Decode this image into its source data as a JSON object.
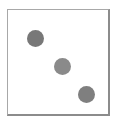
{
  "panel": {
    "label": "dot-panel",
    "background_color": "#ffffff",
    "border_color": "#a8a8a8",
    "border_shadow_color": "#8c8c8c",
    "frame": {
      "left": 7,
      "top": 9,
      "width": 103,
      "height": 107
    }
  },
  "chart_data": {
    "type": "scatter",
    "title": "",
    "subtitle": "",
    "xlabel": "",
    "ylabel": "",
    "xlim": [
      0,
      100
    ],
    "ylim": [
      0,
      100
    ],
    "grid": false,
    "legend": null,
    "tick_labels": {
      "x": [],
      "y": []
    },
    "annotations": [],
    "marker": {
      "shape": "circle",
      "size_px": 17
    },
    "series": [
      {
        "name": "dots",
        "color": "#7d7d7d",
        "points": [
          {
            "id": "dot-1",
            "x": 21,
            "y": 74,
            "px_left": 19,
            "px_top": 20,
            "px_diameter": 17,
            "color": "#787878"
          },
          {
            "id": "dot-2",
            "x": 48,
            "y": 46,
            "px_left": 46,
            "px_top": 48,
            "px_diameter": 17,
            "color": "#8a8a8a"
          },
          {
            "id": "dot-3",
            "x": 72,
            "y": 19,
            "px_left": 70,
            "px_top": 76,
            "px_diameter": 17,
            "color": "#7f7f7f"
          }
        ]
      }
    ]
  }
}
